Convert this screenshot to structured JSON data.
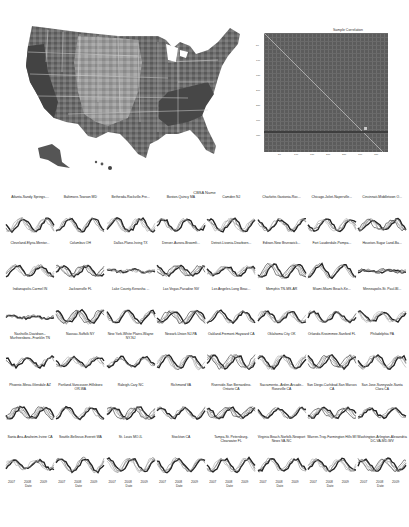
{
  "figure": {
    "map": {
      "label": "US county choropleth map (grayscale)"
    },
    "correlation": {
      "title": "Sample Correlation",
      "y_ticks": [
        "50",
        "100",
        "150",
        "200",
        "250",
        "300",
        "350"
      ],
      "x_ticks": [
        "50",
        "100",
        "150",
        "200",
        "250",
        "300",
        "350"
      ]
    },
    "grid": {
      "title": "CBSA Name",
      "x_label": "Date",
      "x_ticks": [
        "2007",
        "2008",
        "2009"
      ]
    }
  },
  "chart_data": [
    {
      "type": "heatmap",
      "title": "Sample Correlation",
      "xlabel": "",
      "ylabel": "",
      "x_ticks": [
        "50",
        "100",
        "150",
        "200",
        "250",
        "300",
        "350"
      ],
      "y_ticks": [
        "50",
        "100",
        "150",
        "200",
        "250",
        "300",
        "350"
      ],
      "notes": "Square correlation matrix with bright diagonal; mid-gray background"
    },
    {
      "type": "line",
      "title": "CBSA Name",
      "xlabel": "Date",
      "x_ticks": [
        "2007",
        "2008",
        "2009"
      ],
      "layout": {
        "rows": 6,
        "cols": 8
      },
      "panels": [
        "Atlanta-Sandy Springs-...",
        "Baltimore-Towson MD",
        "Bethesda-Rockville-Fre...",
        "Boston-Quincy MA",
        "Camden NJ",
        "Charlotte-Gastonia-Roc...",
        "Chicago-Joliet-Naperville...",
        "Cincinnati-Middletown O...",
        "Cleveland-Elyria-Mentor...",
        "Columbus OH",
        "Dallas-Plano-Irving TX",
        "Denver-Aurora-Broomfi...",
        "Detroit-Livonia-Dearborn...",
        "Edison-New Brunswick...",
        "Fort Lauderdale-Pompa...",
        "Houston-Sugar Land-Ba...",
        "Indianapolis-Carmel IN",
        "Jacksonville FL",
        "Lake County-Kenosha ...",
        "Las Vegas-Paradise NV",
        "Los Angeles-Long Beac...",
        "Memphis TN-MS-AR",
        "Miami-Miami Beach-Ke...",
        "Minneapolis-St. Paul-Bl...",
        "Nashville-Davidson--Murfreesboro--Franklin TN",
        "Nassau-Suffolk NY",
        "New York-White Plains-Wayne NY-NJ",
        "Newark-Union NJ-PA",
        "Oakland-Fremont-Hayward CA",
        "Oklahoma City OK",
        "Orlando-Kissimmee-Sanford FL",
        "Philadelphia PA",
        "Phoenix-Mesa-Glendale AZ",
        "Portland-Vancouver-Hillsboro OR-WA",
        "Raleigh-Cary NC",
        "Richmond VA",
        "Riverside-San Bernardino-Ontario CA",
        "Sacramento--Arden-Arcade--Roseville CA",
        "San Diego-Carlsbad-San Marcos CA",
        "San Jose-Sunnyvale-Santa Clara CA",
        "Santa Ana-Anaheim-Irvine CA",
        "Seattle-Bellevue-Everett WA",
        "St. Louis MO-IL",
        "Stockton CA",
        "Tampa-St. Petersburg-Clearwater FL",
        "Virginia Beach-Norfolk-Newport News VA-NC",
        "Warren-Troy-Farmington Hills MI",
        "Washington-Arlington-Alexandria DC-VA-MD-WV"
      ]
    }
  ],
  "panels": [
    {
      "t": "Atlanta-Sandy Springs-..."
    },
    {
      "t": "Baltimore-Towson MD"
    },
    {
      "t": "Bethesda-Rockville-Fre..."
    },
    {
      "t": "Boston-Quincy MA"
    },
    {
      "t": "Camden NJ"
    },
    {
      "t": "Charlotte-Gastonia-Roc..."
    },
    {
      "t": "Chicago-Joliet-Naperville..."
    },
    {
      "t": "Cincinnati-Middletown O..."
    },
    {
      "t": "Cleveland-Elyria-Mentor..."
    },
    {
      "t": "Columbus OH"
    },
    {
      "t": "Dallas-Plano-Irving TX"
    },
    {
      "t": "Denver-Aurora-Broomfi..."
    },
    {
      "t": "Detroit-Livonia-Dearborn..."
    },
    {
      "t": "Edison-New Brunswick..."
    },
    {
      "t": "Fort Lauderdale-Pompa..."
    },
    {
      "t": "Houston-Sugar Land-Ba..."
    },
    {
      "t": "Indianapolis-Carmel IN"
    },
    {
      "t": "Jacksonville FL"
    },
    {
      "t": "Lake County-Kenosha ..."
    },
    {
      "t": "Las Vegas-Paradise NV"
    },
    {
      "t": "Los Angeles-Long Beac..."
    },
    {
      "t": "Memphis TN-MS-AR"
    },
    {
      "t": "Miami-Miami Beach-Ke..."
    },
    {
      "t": "Minneapolis-St. Paul-Bl..."
    },
    {
      "t": "Nashville-Davidson--Murfreesboro--Franklin TN"
    },
    {
      "t": "Nassau-Suffolk NY"
    },
    {
      "t": "New York-White Plains-Wayne NY-NJ"
    },
    {
      "t": "Newark-Union NJ-PA"
    },
    {
      "t": "Oakland-Fremont-Hayward CA"
    },
    {
      "t": "Oklahoma City OK"
    },
    {
      "t": "Orlando-Kissimmee-Sanford FL"
    },
    {
      "t": "Philadelphia PA"
    },
    {
      "t": "Phoenix-Mesa-Glendale AZ"
    },
    {
      "t": "Portland-Vancouver-Hillsboro OR-WA"
    },
    {
      "t": "Raleigh-Cary NC"
    },
    {
      "t": "Richmond VA"
    },
    {
      "t": "Riverside-San Bernardino-Ontario CA"
    },
    {
      "t": "Sacramento--Arden-Arcade--Roseville CA"
    },
    {
      "t": "San Diego-Carlsbad-San Marcos CA"
    },
    {
      "t": "San Jose-Sunnyvale-Santa Clara CA"
    },
    {
      "t": "Santa Ana-Anaheim-Irvine CA"
    },
    {
      "t": "Seattle-Bellevue-Everett WA"
    },
    {
      "t": "St. Louis MO-IL"
    },
    {
      "t": "Stockton CA"
    },
    {
      "t": "Tampa-St. Petersburg-Clearwater FL"
    },
    {
      "t": "Virginia Beach-Norfolk-Newport News VA-NC"
    },
    {
      "t": "Warren-Troy-Farmington Hills MI"
    },
    {
      "t": "Washington-Arlington-Alexandria DC-VA-MD-WV"
    }
  ]
}
